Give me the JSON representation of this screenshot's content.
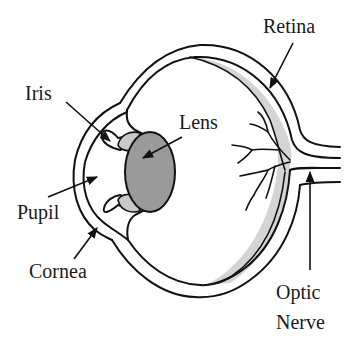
{
  "diagram": {
    "colors": {
      "background": "#ffffff",
      "outline": "#111111",
      "lens_fill": "#9a9a9a",
      "iris_fill": "#c9c9c9",
      "retina_fill": "#d4d4d4"
    },
    "labels": {
      "retina": "Retina",
      "iris": "Iris",
      "lens": "Lens",
      "pupil": "Pupil",
      "cornea": "Cornea",
      "optic_line1": "Optic",
      "optic_line2": "Nerve"
    }
  }
}
